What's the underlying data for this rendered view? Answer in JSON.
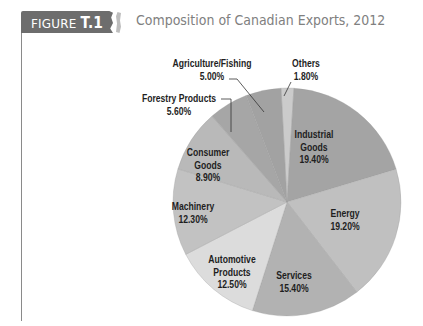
{
  "header": {
    "figure_word": "FIGURE",
    "figure_number": "T.1",
    "title": "Composition of Canadian Exports, 2012"
  },
  "colors": {
    "tab": "#6d6d6d",
    "title_text": "#808080",
    "rule": "#8a8a8a",
    "label_text": "#1e1e1e",
    "leader": "#333333"
  },
  "chart_data": {
    "type": "pie",
    "title": "Composition of Canadian Exports, 2012",
    "start_angle_deg": -3,
    "direction": "clockwise",
    "center": [
      287,
      202
    ],
    "radius": 114,
    "slices": [
      {
        "label": "Others",
        "value": 1.8,
        "display": "1.80%",
        "color": "#cbcbcb"
      },
      {
        "label": "Industrial Goods",
        "value": 19.4,
        "display": "19.40%",
        "color": "#a4a4a4"
      },
      {
        "label": "Energy",
        "value": 19.2,
        "display": "19.20%",
        "color": "#c0c0c0"
      },
      {
        "label": "Services",
        "value": 15.4,
        "display": "15.40%",
        "color": "#b2b2b2"
      },
      {
        "label": "Automotive Products",
        "value": 12.5,
        "display": "12.50%",
        "color": "#dcdcdc"
      },
      {
        "label": "Machinery",
        "value": 12.3,
        "display": "12.30%",
        "color": "#c2c2c2"
      },
      {
        "label": "Consumer Goods",
        "value": 8.9,
        "display": "8.90%",
        "color": "#b9b9b9"
      },
      {
        "label": "Forestry Products",
        "value": 5.6,
        "display": "5.60%",
        "color": "#a6a6a6"
      },
      {
        "label": "Agriculture/Fishing",
        "value": 5.0,
        "display": "5.00%",
        "color": "#a2a2a2"
      }
    ],
    "labels": {
      "industrial_goods": {
        "line1": "Industrial",
        "line2": "Goods",
        "pct": "19.40%"
      },
      "energy": {
        "line1": "Energy",
        "pct": "19.20%"
      },
      "services": {
        "line1": "Services",
        "pct": "15.40%"
      },
      "automotive": {
        "line1": "Automotive",
        "line2": "Products",
        "pct": "12.50%"
      },
      "machinery": {
        "line1": "Machinery",
        "pct": "12.30%"
      },
      "consumer_goods": {
        "line1": "Consumer",
        "line2": "Goods",
        "pct": "8.90%"
      },
      "forestry": {
        "line1": "Forestry Products",
        "pct": "5.60%"
      },
      "agriculture": {
        "line1": "Agriculture/Fishing",
        "pct": "5.00%"
      },
      "others": {
        "line1": "Others",
        "pct": "1.80%"
      }
    },
    "legend": "none (direct labels with leader lines)"
  }
}
